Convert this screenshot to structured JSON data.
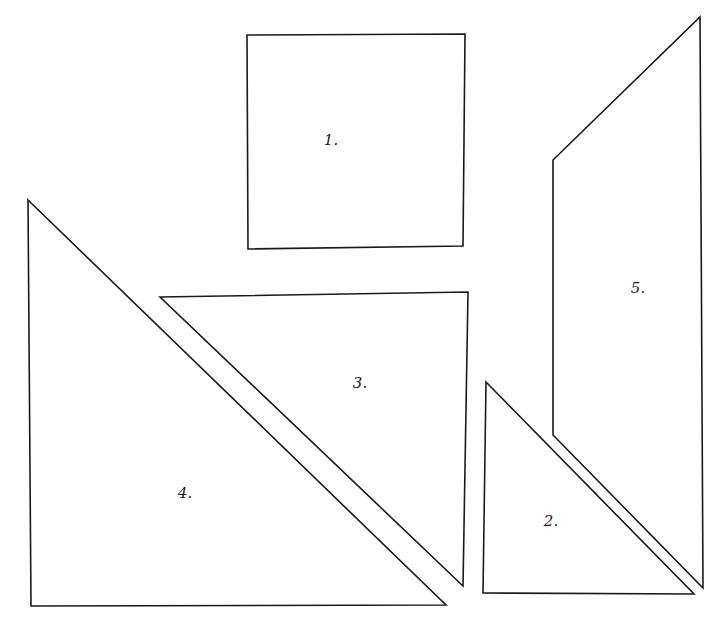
{
  "diagram": {
    "title": "",
    "canvas": {
      "width": 725,
      "height": 632,
      "background": "#ffffff",
      "stroke": "#1a1a1a"
    },
    "pieces": [
      {
        "id": "1",
        "label": "1.",
        "shape": "square",
        "points": [
          [
            247,
            35
          ],
          [
            465,
            34
          ],
          [
            463,
            246
          ],
          [
            248,
            249
          ]
        ],
        "label_pos": [
          331,
          140
        ]
      },
      {
        "id": "2",
        "label": "2.",
        "shape": "right-triangle",
        "points": [
          [
            486,
            382
          ],
          [
            694,
            594
          ],
          [
            483,
            593
          ]
        ],
        "label_pos": [
          551,
          521
        ]
      },
      {
        "id": "3",
        "label": "3.",
        "shape": "right-triangle",
        "points": [
          [
            160,
            297
          ],
          [
            468,
            292
          ],
          [
            463,
            586
          ]
        ],
        "label_pos": [
          360,
          383
        ]
      },
      {
        "id": "4",
        "label": "4.",
        "shape": "right-triangle",
        "points": [
          [
            28,
            200
          ],
          [
            446,
            605
          ],
          [
            31,
            606
          ]
        ],
        "label_pos": [
          185,
          493
        ]
      },
      {
        "id": "5",
        "label": "5.",
        "shape": "trapezoid",
        "points": [
          [
            553,
            160
          ],
          [
            700,
            17
          ],
          [
            703,
            588
          ],
          [
            553,
            435
          ]
        ],
        "label_pos": [
          638,
          288
        ]
      }
    ]
  }
}
